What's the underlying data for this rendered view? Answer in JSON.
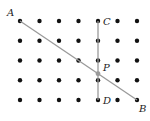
{
  "diagram": {
    "grid": {
      "cols": 7,
      "rows": 5,
      "x": [
        20,
        39.5,
        59,
        78.5,
        98,
        117.5,
        137
      ],
      "y": [
        21,
        40.8,
        60.5,
        80.3,
        100
      ],
      "dot_color": "#111111",
      "dot_radius": 2.2
    },
    "segments": [
      {
        "name": "AB",
        "from": [
          20,
          21
        ],
        "to": [
          137,
          100
        ],
        "color": "#9a9a9a"
      },
      {
        "name": "CD",
        "from": [
          98,
          21
        ],
        "to": [
          98,
          100
        ],
        "color": "#9a9a9a"
      }
    ],
    "points": {
      "A": {
        "label": "A",
        "x": 20,
        "y": 21
      },
      "B": {
        "label": "B",
        "x": 137,
        "y": 100
      },
      "C": {
        "label": "C",
        "x": 98,
        "y": 21
      },
      "D": {
        "label": "D",
        "x": 98,
        "y": 100
      },
      "P": {
        "label": "P",
        "x": 98,
        "y": 73.7
      }
    }
  }
}
